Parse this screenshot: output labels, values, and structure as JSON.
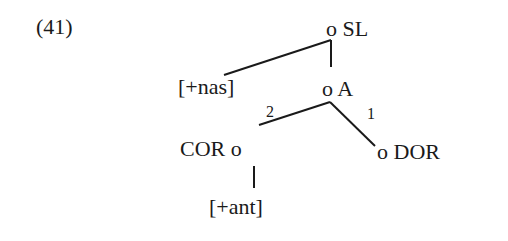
{
  "example": {
    "number": "(41)"
  },
  "tree": {
    "nodes": {
      "sl": {
        "marker": "o",
        "label": "SL"
      },
      "a": {
        "marker": "o",
        "label": "A"
      },
      "cor": {
        "marker": "o",
        "label": "COR"
      },
      "dor": {
        "marker": "o",
        "label": "DOR"
      }
    },
    "features": {
      "nas": "[+nas]",
      "ant": "[+ant]"
    },
    "branch_labels": {
      "cor_branch": "2",
      "dor_branch": "1"
    },
    "edges": [
      {
        "from": "SL",
        "to": "[+nas]"
      },
      {
        "from": "SL",
        "to": "A"
      },
      {
        "from": "A",
        "to": "COR",
        "label": "2"
      },
      {
        "from": "A",
        "to": "DOR",
        "label": "1"
      },
      {
        "from": "COR",
        "to": "[+ant]"
      }
    ],
    "line_color": "#1a1a1a"
  }
}
